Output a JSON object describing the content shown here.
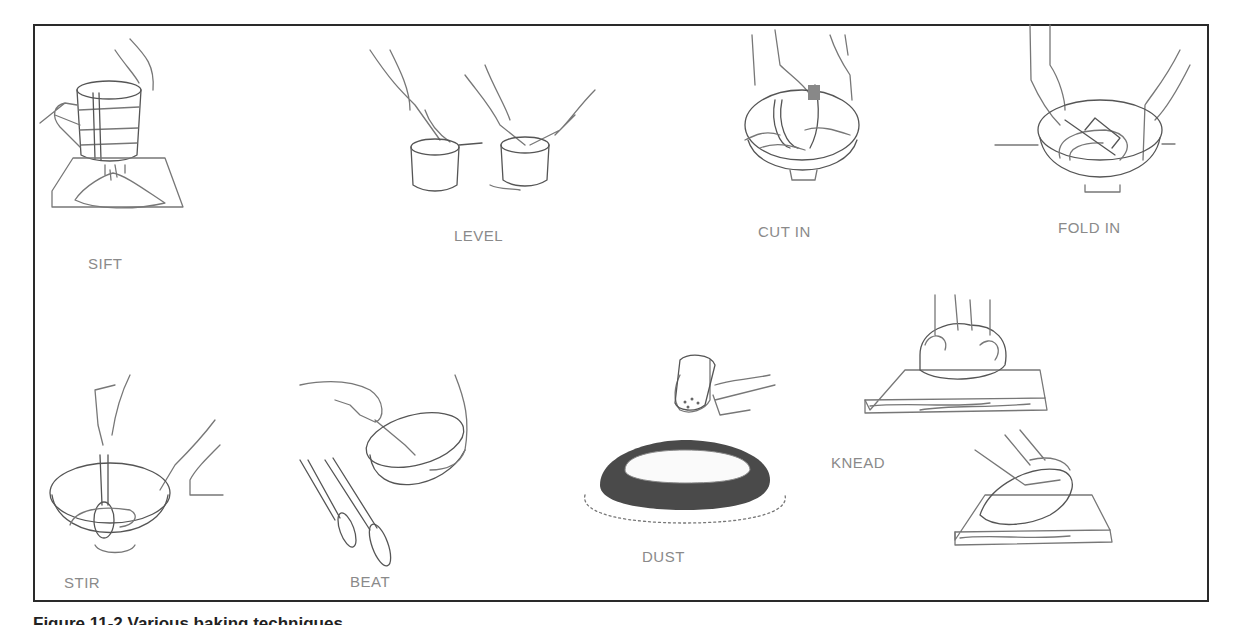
{
  "figure": {
    "caption": "Figure 11-2 Various baking techniques",
    "caption_visible": "partially cut off at bottom edge",
    "colors": {
      "frame": "#2a2a2a",
      "line_art": "#777777",
      "label_text": "#8a8a8a",
      "pan": "#4a4a4a"
    },
    "techniques": [
      {
        "id": "sift",
        "label": "SIFT",
        "illustration": "hand-held flour sifter over paper with flour mound"
      },
      {
        "id": "level",
        "label": "LEVEL",
        "illustration": "spatula leveling flour in measuring cups"
      },
      {
        "id": "cut-in",
        "label": "CUT IN",
        "illustration": "pastry blender cutting fat into flour in bowl"
      },
      {
        "id": "fold-in",
        "label": "FOLD IN",
        "illustration": "rubber spatula folding batter in bowl"
      },
      {
        "id": "stir",
        "label": "STIR",
        "illustration": "spoon stirring mixture in bowl"
      },
      {
        "id": "beat",
        "label": "BEAT",
        "illustration": "beating in tilted bowl with whisks beside"
      },
      {
        "id": "dust",
        "label": "DUST",
        "illustration": "shaker dusting sugar over cake in pan"
      },
      {
        "id": "knead",
        "label": "KNEAD",
        "illustration": "hands kneading dough on wooden board (two steps)"
      }
    ]
  }
}
